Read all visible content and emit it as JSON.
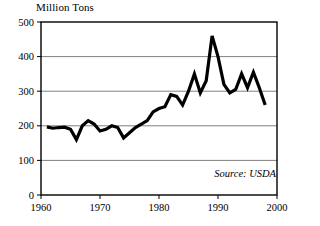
{
  "chart_data": {
    "type": "line",
    "title": "Million Tons",
    "xlabel": "",
    "ylabel": "",
    "source_note": "Source: USDA",
    "grid": true,
    "grid_axis": "y",
    "legend": "none",
    "xlim": [
      1960,
      2000
    ],
    "ylim": [
      0,
      500
    ],
    "xticks": [
      1960,
      1970,
      1980,
      1990,
      2000
    ],
    "xtick_labels": [
      "1960",
      "1970",
      "1980",
      "1990",
      "2000"
    ],
    "yticks": [
      0,
      100,
      200,
      300,
      400,
      500
    ],
    "ytick_labels": [
      "0",
      "100",
      "200",
      "300",
      "400",
      "500"
    ],
    "series": [
      {
        "name": "Million Tons",
        "x": [
          1961,
          1962,
          1963,
          1964,
          1965,
          1966,
          1967,
          1968,
          1969,
          1970,
          1971,
          1972,
          1973,
          1974,
          1975,
          1976,
          1977,
          1978,
          1979,
          1980,
          1981,
          1982,
          1983,
          1984,
          1985,
          1986,
          1987,
          1988,
          1989,
          1990,
          1991,
          1992,
          1993,
          1994,
          1995,
          1996,
          1997,
          1998
        ],
        "values": [
          197,
          193,
          195,
          196,
          190,
          160,
          200,
          215,
          205,
          185,
          190,
          200,
          195,
          165,
          180,
          195,
          205,
          215,
          240,
          250,
          255,
          290,
          285,
          260,
          300,
          350,
          295,
          330,
          460,
          400,
          320,
          295,
          305,
          350,
          310,
          355,
          310,
          260
        ]
      }
    ],
    "line_color": "#000000",
    "line_width": 3.2,
    "frame_color": "#000000",
    "grid_color": "#808080"
  }
}
